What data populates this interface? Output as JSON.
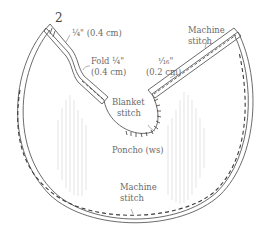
{
  "diagram": {
    "step_number": "2",
    "labels": {
      "quarter_inch": "¼\" (0.4 cm)",
      "fold_line1": "Fold ¼\"",
      "fold_line2": "(0.4 cm)",
      "sixteenth_line1": "¹⁄₁₆\"",
      "sixteenth_line2": "(0.2 cm)",
      "machine_stitch_top_line1": "Machine",
      "machine_stitch_top_line2": "stitch",
      "blanket_stitch_line1": "Blanket",
      "blanket_stitch_line2": "stitch",
      "poncho": "Poncho (ws)",
      "machine_stitch_bottom_line1": "Machine",
      "machine_stitch_bottom_line2": "stitch"
    },
    "colors": {
      "outline": "#5a5a5a",
      "stitch": "#3a3a3a",
      "label": "#6a6a6a",
      "grain": "#d9d9d9"
    }
  }
}
